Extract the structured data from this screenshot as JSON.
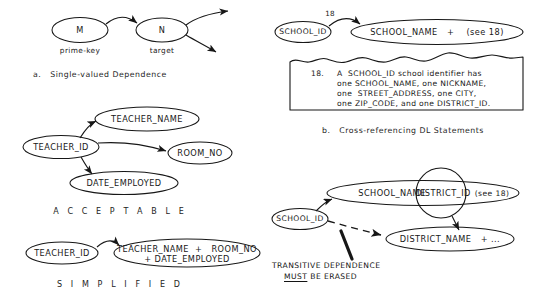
{
  "figure": {
    "ink_color": "#171717",
    "paper_color": "#ffffff"
  },
  "panel_a": {
    "caption": "a.   Single-valued Dependence",
    "nodes": [
      {
        "id": "m",
        "label": "M",
        "sublabel": "prime-key"
      },
      {
        "id": "n",
        "label": "N",
        "sublabel": "target"
      }
    ]
  },
  "panel_b": {
    "caption": "b.   Cross-referencing DL Statements",
    "edge_label": "18",
    "nodes": [
      {
        "id": "school_id",
        "label": "SCHOOL_ID"
      },
      {
        "id": "school_name",
        "label": "SCHOOL_NAME   +    (see 18)"
      }
    ],
    "note": {
      "number": "18.",
      "lines": [
        "A  SCHOOL_ID school identifier has",
        "one SCHOOL_NAME, one NICKNAME,",
        "one  STREET_ADDRESS, one CITY,",
        "one ZIP_CODE, and one DISTRICT_ID."
      ]
    }
  },
  "panel_acceptable": {
    "section_label": "A C C E P T A B L E",
    "nodes": [
      {
        "id": "teacher_id",
        "label": "TEACHER_ID"
      },
      {
        "id": "teacher_name",
        "label": "TEACHER_NAME"
      },
      {
        "id": "room_no",
        "label": "ROOM_NO"
      },
      {
        "id": "date_employed",
        "label": "DATE_EMPLOYED"
      }
    ]
  },
  "panel_simplified": {
    "section_label": "S I M P L I F I E D",
    "nodes": [
      {
        "id": "teacher_id",
        "label": "TEACHER_ID"
      },
      {
        "id": "combined",
        "line1": "TEACHER_NAME  +   ROOM_NO",
        "line2": "+ DATE_EMPLOYED"
      }
    ]
  },
  "panel_transitive": {
    "nodes": [
      {
        "id": "school_id",
        "label": "SCHOOL_ID"
      },
      {
        "id": "school_name",
        "label_a": "SCHOOL_NAME",
        "label_b": "DISTRICT_ID",
        "label_c": "(see 18)"
      },
      {
        "id": "district_name",
        "label": "DISTRICT_NAME   + ..."
      }
    ],
    "warning": {
      "line1": "TRANSITIVE DEPENDENCE",
      "line2_underlined": "MUST",
      "line2_rest": " BE ERASED"
    }
  }
}
